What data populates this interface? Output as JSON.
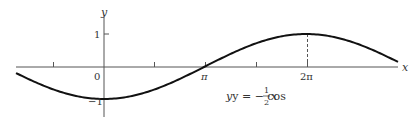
{
  "chart_data": {
    "type": "line",
    "title": "",
    "xlabel": "x",
    "ylabel": "y",
    "function": "y = -cos(x/2)",
    "annotation": {
      "equation_lhs": "y = − cos ",
      "frac_num": "1",
      "frac_den": "2",
      "equation_var": "x"
    },
    "x_tick_labels": [
      {
        "value": 0,
        "label": "0"
      },
      {
        "value": 3.14159,
        "label": "π"
      },
      {
        "value": 6.28318,
        "label": "2π"
      }
    ],
    "x_ticks": [
      -1.5708,
      1.5708,
      3.14159,
      4.71239,
      6.28318
    ],
    "y_tick_labels": [
      {
        "value": 1,
        "label": "1"
      },
      {
        "value": -1,
        "label": "−1"
      }
    ],
    "xlim": [
      -2.73,
      9.15
    ],
    "ylim": [
      -1.6,
      1.7
    ],
    "key_points": [
      {
        "x": 0,
        "y": -1
      },
      {
        "x": 3.14159,
        "y": 0
      },
      {
        "x": 6.28318,
        "y": 1
      }
    ],
    "dashed_guide": {
      "x": 6.28318,
      "from_y": 0,
      "to_y": 1
    },
    "grid": false,
    "legend": null,
    "colors": {
      "curve": "#111111",
      "axis": "#555555",
      "text": "#333333"
    }
  }
}
